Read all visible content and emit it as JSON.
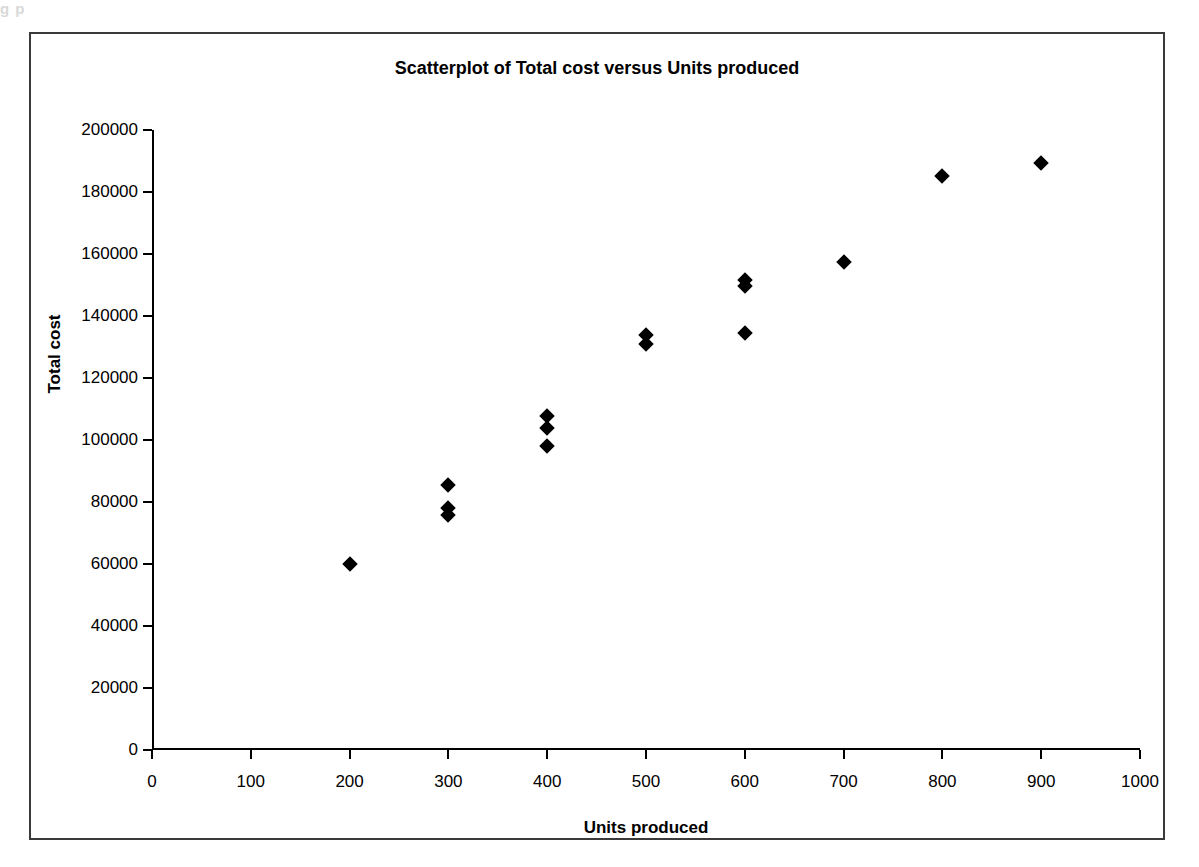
{
  "scan_artifact": "g                 p",
  "chart_data": {
    "type": "scatter",
    "title": "Scatterplot of Total cost versus Units produced",
    "xlabel": "Units produced",
    "ylabel": "Total cost",
    "xlim": [
      0,
      1000
    ],
    "ylim": [
      0,
      200000
    ],
    "xticks": [
      0,
      100,
      200,
      300,
      400,
      500,
      600,
      700,
      800,
      900,
      1000
    ],
    "xtick_labels": [
      "0",
      "100",
      "200",
      "300",
      "400",
      "500",
      "600",
      "700",
      "800",
      "900",
      "1000"
    ],
    "yticks": [
      0,
      20000,
      40000,
      60000,
      80000,
      100000,
      120000,
      140000,
      160000,
      180000,
      200000
    ],
    "ytick_labels": [
      "0",
      "20000",
      "40000",
      "60000",
      "80000",
      "100000",
      "120000",
      "140000",
      "160000",
      "180000",
      "200000"
    ],
    "grid": false,
    "legend": false,
    "marker": "diamond",
    "marker_color": "#000000",
    "points": [
      {
        "x": 200,
        "y": 60000
      },
      {
        "x": 300,
        "y": 85600
      },
      {
        "x": 300,
        "y": 78000
      },
      {
        "x": 300,
        "y": 75800
      },
      {
        "x": 400,
        "y": 107800
      },
      {
        "x": 400,
        "y": 104000
      },
      {
        "x": 400,
        "y": 98000
      },
      {
        "x": 500,
        "y": 133800
      },
      {
        "x": 500,
        "y": 131000
      },
      {
        "x": 600,
        "y": 151600
      },
      {
        "x": 600,
        "y": 149800
      },
      {
        "x": 600,
        "y": 134500
      },
      {
        "x": 700,
        "y": 157500
      },
      {
        "x": 800,
        "y": 185200
      },
      {
        "x": 900,
        "y": 189300
      }
    ]
  },
  "colors": {
    "frame": "#3a3a3a",
    "axis": "#000000",
    "background": "#ffffff"
  }
}
